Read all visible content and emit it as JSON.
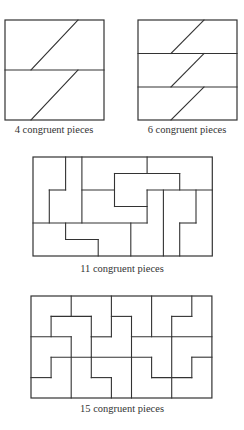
{
  "figures": [
    {
      "id": "fig4",
      "caption": "4 congruent pieces",
      "caption_pos": [
        54,
        125
      ],
      "rect": [
        5,
        20,
        99,
        100
      ],
      "segments": [
        [
          5,
          70,
          104,
          70
        ],
        [
          31,
          70,
          78,
          20
        ],
        [
          31,
          120,
          78,
          70
        ]
      ]
    },
    {
      "id": "fig6",
      "caption": "6 congruent pieces",
      "caption_pos": [
        187,
        125
      ],
      "rect": [
        138,
        20,
        99,
        100
      ],
      "segments": [
        [
          138,
          53.5,
          237,
          53.5
        ],
        [
          138,
          87,
          237,
          87
        ],
        [
          171,
          53.5,
          204,
          20
        ],
        [
          171,
          87,
          204,
          53.5
        ],
        [
          171,
          120,
          204,
          87
        ]
      ]
    },
    {
      "id": "fig11",
      "caption": "11 congruent pieces",
      "caption_pos": [
        122,
        264
      ],
      "grid": {
        "x0": 33,
        "y0": 157,
        "ux": 16.3,
        "uy": 16.5,
        "cols": 11,
        "rows": 6
      },
      "grid_segments": [
        [
          2,
          0,
          2,
          2
        ],
        [
          1,
          2,
          2,
          2
        ],
        [
          1,
          2,
          1,
          4
        ],
        [
          3,
          0,
          3,
          4
        ],
        [
          0,
          4,
          7,
          4
        ],
        [
          3,
          2,
          5,
          2
        ],
        [
          5,
          1,
          5,
          3
        ],
        [
          5,
          1,
          9,
          1
        ],
        [
          9,
          1,
          9,
          2
        ],
        [
          5,
          3,
          7,
          3
        ],
        [
          7,
          0,
          7,
          1
        ],
        [
          7,
          2,
          7,
          4
        ],
        [
          7,
          2,
          11,
          2
        ],
        [
          8,
          2,
          8,
          6
        ],
        [
          10,
          2,
          10,
          4
        ],
        [
          9,
          4,
          10,
          4
        ],
        [
          9,
          4,
          9,
          6
        ],
        [
          2,
          4,
          2,
          5
        ],
        [
          2,
          5,
          4,
          5
        ],
        [
          4,
          5,
          4,
          6
        ],
        [
          6,
          4,
          6,
          6
        ]
      ]
    },
    {
      "id": "fig15",
      "caption": "15 congruent pieces",
      "caption_pos": [
        122,
        403
      ],
      "grid": {
        "x0": 31,
        "y0": 296,
        "ux": 20.1,
        "uy": 20.4,
        "cols": 9,
        "rows": 5
      },
      "grid_segments": [
        [
          2,
          0,
          2,
          1
        ],
        [
          4,
          0,
          4,
          2
        ],
        [
          6,
          0,
          6,
          2
        ],
        [
          8,
          0,
          8,
          1
        ],
        [
          1,
          1,
          3,
          1
        ],
        [
          4,
          1,
          5,
          1
        ],
        [
          7,
          1,
          8,
          1
        ],
        [
          1,
          1,
          1,
          2
        ],
        [
          3,
          1,
          3,
          2
        ],
        [
          5,
          1,
          5,
          2
        ],
        [
          7,
          1,
          7,
          2
        ],
        [
          0,
          2,
          2,
          2
        ],
        [
          3,
          2,
          4,
          2
        ],
        [
          5,
          2,
          9,
          2
        ],
        [
          2,
          2,
          2,
          5
        ],
        [
          3,
          2,
          3,
          3
        ],
        [
          5,
          2,
          5,
          5
        ],
        [
          7,
          2,
          7,
          5
        ],
        [
          1,
          3,
          6,
          3
        ],
        [
          8,
          3,
          9,
          3
        ],
        [
          1,
          3,
          1,
          4
        ],
        [
          3,
          3,
          3,
          4
        ],
        [
          6,
          3,
          6,
          4
        ],
        [
          8,
          3,
          8,
          4
        ],
        [
          0,
          4,
          1,
          4
        ],
        [
          3,
          4,
          4,
          4
        ],
        [
          6,
          4,
          8,
          4
        ],
        [
          4,
          4,
          4,
          5
        ]
      ]
    }
  ],
  "style": {
    "stroke": "#333333",
    "background": "#ffffff"
  }
}
